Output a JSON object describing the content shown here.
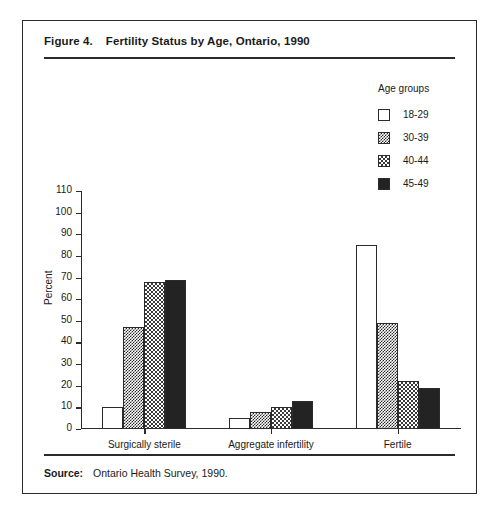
{
  "figure": {
    "number": "Figure 4.",
    "title": "Fertility Status by Age, Ontario, 1990"
  },
  "source": {
    "label": "Source:",
    "text": "Ontario Health Survey, 1990."
  },
  "legend": {
    "title": "Age groups",
    "items": [
      {
        "label": "18-29",
        "pattern": "white"
      },
      {
        "label": "30-39",
        "pattern": "dark-checker"
      },
      {
        "label": "40-44",
        "pattern": "light-checker"
      },
      {
        "label": "45-49",
        "pattern": "solid-black"
      }
    ]
  },
  "chart_data": {
    "type": "bar",
    "title": "Fertility Status by Age, Ontario, 1990",
    "xlabel": "",
    "ylabel": "Percent",
    "ylim": [
      0,
      110
    ],
    "ytick_step": 10,
    "yticks": [
      0,
      10,
      20,
      30,
      40,
      50,
      60,
      70,
      80,
      90,
      100,
      110
    ],
    "grid": false,
    "legend_position": "top-right",
    "categories": [
      "Surgically sterile",
      "Aggregate infertility",
      "Fertile"
    ],
    "series": [
      {
        "name": "18-29",
        "values": [
          10,
          5,
          85
        ]
      },
      {
        "name": "30-39",
        "values": [
          47,
          8,
          49
        ]
      },
      {
        "name": "40-44",
        "values": [
          68,
          10,
          22
        ]
      },
      {
        "name": "45-49",
        "values": [
          69,
          13,
          19
        ]
      }
    ]
  },
  "colors": {
    "ink": "#2b2b2b",
    "solid_black": "#232323",
    "background": "#ffffff"
  }
}
